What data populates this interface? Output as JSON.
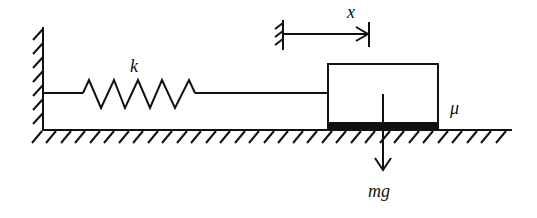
{
  "diagram": {
    "labels": {
      "spring_constant": "k",
      "displacement": "x",
      "friction_coefficient": "μ",
      "weight": "mg"
    },
    "colors": {
      "stroke": "#111111",
      "background": "#ffffff"
    },
    "elements": {
      "wall": {
        "x": 43,
        "y_top": 27,
        "y_bottom": 130
      },
      "floor": {
        "y": 130,
        "x_start": 43,
        "x_end": 512
      },
      "spring": {
        "y": 93,
        "x_start": 43,
        "x_end": 328,
        "coil_start": 83,
        "coil_end": 198
      },
      "block": {
        "x": 328,
        "y": 64,
        "width": 110,
        "height": 66,
        "pad_height": 8
      },
      "displacement_arrow": {
        "x_start": 283,
        "x_end": 369,
        "y": 34
      },
      "weight_arrow": {
        "x": 383,
        "y_start": 94,
        "y_end": 170
      }
    }
  }
}
